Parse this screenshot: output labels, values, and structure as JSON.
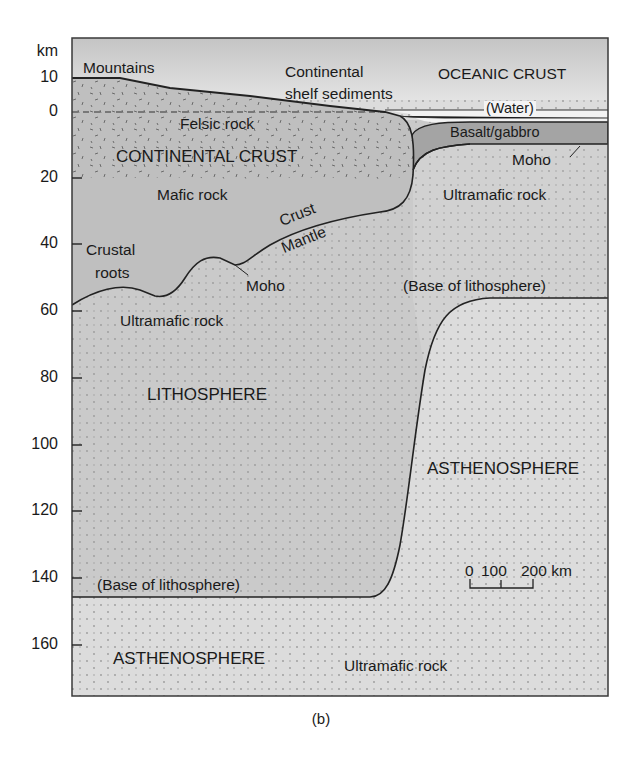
{
  "figure": {
    "panel_label": "(b)",
    "axis": {
      "unit": "km",
      "ticks": [
        {
          "label": "10",
          "y": 78
        },
        {
          "label": "0",
          "y": 112
        },
        {
          "label": "20",
          "y": 178
        },
        {
          "label": "40",
          "y": 244
        },
        {
          "label": "60",
          "y": 311
        },
        {
          "label": "80",
          "y": 378
        },
        {
          "label": "100",
          "y": 445
        },
        {
          "label": "120",
          "y": 511
        },
        {
          "label": "140",
          "y": 578
        },
        {
          "label": "160",
          "y": 645
        }
      ]
    },
    "labels": {
      "mountains": "Mountains",
      "shelf_line1": "Continental",
      "shelf_line2": "shelf sediments",
      "oceanic_crust": "OCEANIC CRUST",
      "water": "(Water)",
      "felsic": "Felsic rock",
      "continental_crust": "CONTINENTAL CRUST",
      "basalt": "Basalt/gabbro",
      "moho_ocean": "Moho",
      "mafic": "Mafic rock",
      "ultramafic_ocean": "Ultramafic rock",
      "crust": "Crust",
      "mantle": "Mantle",
      "crustal_roots_1": "Crustal",
      "crustal_roots_2": "roots",
      "moho_cont": "Moho",
      "base_litho_right": "(Base of lithosphere)",
      "ultramafic_cont": "Ultramafic rock",
      "lithosphere": "LITHOSPHERE",
      "asthenosphere_right": "ASTHENOSPHERE",
      "base_litho_left": "(Base of lithosphere)",
      "asthenosphere_bottom": "ASTHENOSPHERE",
      "ultramafic_bottom": "Ultramafic rock"
    },
    "scale_bar": {
      "labels": [
        "0",
        "100",
        "200 km"
      ]
    },
    "colors": {
      "frame": "#3a3a3a",
      "air_top": "#c9c9c9",
      "air_bottom": "#f4f4f4",
      "continental_crust": "#bdbdbd",
      "basalt": "#9e9e9e",
      "lithosphere_mantle": "#cfcfcf",
      "asthenosphere": "#dcdcdc",
      "water": "#f0f0f0",
      "line": "#222222"
    }
  }
}
